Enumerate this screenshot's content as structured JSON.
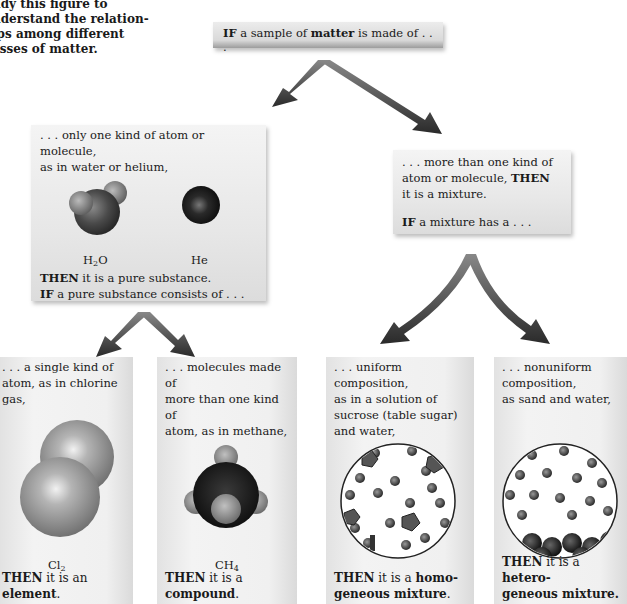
{
  "intro": {
    "lines": [
      "udy this figure to",
      "nderstand the relation-",
      "ips among different",
      "asses of matter."
    ]
  },
  "top": {
    "if": "IF",
    "pre": "a sample of",
    "matter": "matter",
    "post": "is made of . . ."
  },
  "pure": {
    "line1": ". . . only one kind of atom or molecule,",
    "line2": "as in water or helium,",
    "water_label": "H",
    "water_sub": "2",
    "water_suffix": "O",
    "helium_label": "He",
    "then": "THEN",
    "then_text": "it is a pure substance.",
    "if": "IF",
    "if_text": "a pure substance consists of . . ."
  },
  "mixture": {
    "line1": ". . . more than one kind of",
    "line2": "atom or molecule,",
    "then": "THEN",
    "line3": "it is a mixture.",
    "if": "IF",
    "if_text": "a mixture has a . . ."
  },
  "columns": [
    {
      "lines": [
        ". . . a single kind of",
        "atom, as in chlorine",
        "gas,"
      ],
      "formula": "Cl",
      "formula_sub": "2",
      "formula_suffix": "",
      "then": "THEN",
      "mid": "it is an",
      "term": "element",
      "end": "."
    },
    {
      "lines": [
        ". . . molecules made of",
        "more than one kind of",
        "atom, as in methane,"
      ],
      "formula": "CH",
      "formula_sub": "4",
      "formula_suffix": "",
      "then": "THEN",
      "mid": "it is a",
      "term": "compound",
      "end": "."
    },
    {
      "lines": [
        ". . . uniform",
        "composition,",
        "as in a solution of",
        "sucrose (table sugar)",
        "and water,"
      ],
      "then": "THEN",
      "mid": "it is a",
      "term_a": "homo-",
      "term": "geneous mixture",
      "end": "."
    },
    {
      "lines": [
        ". . . nonuniform",
        "composition,",
        "as sand and water,"
      ],
      "then": "THEN",
      "mid": "it is a",
      "term_a": "hetero-",
      "term": "geneous mixture.",
      "end": ""
    }
  ],
  "colors": {
    "box_light": "#f4f4f4",
    "box_dark": "#dcdcdc",
    "arrow": "#3a3a3a",
    "text": "#1a1a1a"
  }
}
